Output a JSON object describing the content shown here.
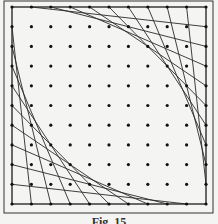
{
  "figure": {
    "caption": "Fig. 15",
    "frame": {
      "x": 4,
      "y": 1,
      "w": 209,
      "h": 212
    },
    "grid": {
      "cols": 11,
      "rows": 11,
      "x0": 12,
      "y0": 7,
      "dx": 19.4,
      "dy": 19.7
    },
    "colors": {
      "line": "#2a2a2a",
      "dot": "#111111",
      "frame": "#333333",
      "background": "#f4f4f2"
    },
    "envelopes": [
      {
        "name": "top-right",
        "from_edge": "top",
        "to_edge": "right"
      },
      {
        "name": "bottom-left",
        "from_edge": "left",
        "to_edge": "bottom"
      }
    ]
  }
}
